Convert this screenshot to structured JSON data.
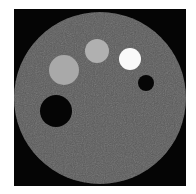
{
  "image": {
    "description": "CT phantom cross-section with contrast inserts",
    "background_color": "#ffffff",
    "frame_color": "#050505",
    "phantom": {
      "cx": 100,
      "cy": 98,
      "r": 86,
      "color": "#5b5b5b"
    },
    "inserts": [
      {
        "name": "large-gray-insert",
        "cx": 64,
        "cy": 70,
        "r": 15,
        "color": "#a9a9a9"
      },
      {
        "name": "medium-gray-insert",
        "cx": 97,
        "cy": 51,
        "r": 12,
        "color": "#b0b0b0"
      },
      {
        "name": "white-insert",
        "cx": 130,
        "cy": 59,
        "r": 11,
        "color": "#fafafa"
      },
      {
        "name": "small-black-insert",
        "cx": 146,
        "cy": 83,
        "r": 8,
        "color": "#060606"
      },
      {
        "name": "large-black-insert",
        "cx": 56,
        "cy": 111,
        "r": 16,
        "color": "#050505"
      }
    ]
  }
}
